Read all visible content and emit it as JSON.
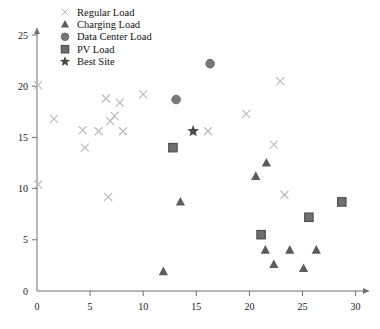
{
  "chart_data": {
    "type": "scatter",
    "title": "",
    "xlabel": "",
    "ylabel": "",
    "xlim": [
      0,
      31.5
    ],
    "ylim": [
      0,
      27.5
    ],
    "xticks": [
      0,
      5,
      10,
      15,
      20,
      25,
      30
    ],
    "yticks": [
      0,
      5,
      10,
      15,
      20,
      25
    ],
    "grid": false,
    "legend_position": "top-left",
    "series": [
      {
        "name": "Regular Load",
        "marker": "x",
        "color": "#b9b9b9",
        "points": [
          [
            0.1,
            20.1
          ],
          [
            1.6,
            16.8
          ],
          [
            0.1,
            10.4
          ],
          [
            4.3,
            15.7
          ],
          [
            4.5,
            14.0
          ],
          [
            5.8,
            15.6
          ],
          [
            6.5,
            18.8
          ],
          [
            6.7,
            9.2
          ],
          [
            6.9,
            16.6
          ],
          [
            7.3,
            17.1
          ],
          [
            7.8,
            18.4
          ],
          [
            8.1,
            15.6
          ],
          [
            10.0,
            19.2
          ],
          [
            16.1,
            15.6
          ],
          [
            19.7,
            17.3
          ],
          [
            22.9,
            20.5
          ],
          [
            22.3,
            14.3
          ],
          [
            23.3,
            9.4
          ]
        ]
      },
      {
        "name": "Charging Load",
        "marker": "triangle",
        "color": "#5c5c5c",
        "points": [
          [
            11.9,
            1.9
          ],
          [
            13.5,
            8.7
          ],
          [
            20.6,
            11.2
          ],
          [
            21.6,
            12.5
          ],
          [
            21.5,
            4.0
          ],
          [
            22.3,
            2.6
          ],
          [
            23.8,
            4.0
          ],
          [
            25.1,
            2.2
          ],
          [
            26.3,
            4.0
          ]
        ]
      },
      {
        "name": "Data Center Load",
        "marker": "circle",
        "color": "#787878",
        "points": [
          [
            13.1,
            18.7
          ],
          [
            16.3,
            22.2
          ]
        ]
      },
      {
        "name": "PV Load",
        "marker": "square",
        "color": "#6f6f6f",
        "points": [
          [
            12.8,
            14.0
          ],
          [
            21.1,
            5.5
          ],
          [
            25.6,
            7.2
          ],
          [
            28.7,
            8.7
          ]
        ]
      },
      {
        "name": "Best Site",
        "marker": "star",
        "color": "#4a4a4a",
        "points": [
          [
            14.7,
            15.6
          ]
        ]
      }
    ]
  },
  "legend": {
    "items": [
      {
        "label": "Regular Load",
        "marker": "x",
        "color": "#b9b9b9"
      },
      {
        "label": "Charging Load",
        "marker": "triangle",
        "color": "#5c5c5c"
      },
      {
        "label": "Data Center Load",
        "marker": "circle",
        "color": "#787878"
      },
      {
        "label": "PV Load",
        "marker": "square",
        "color": "#6f6f6f"
      },
      {
        "label": "Best Site",
        "marker": "star",
        "color": "#4a4a4a"
      }
    ]
  },
  "axes": {
    "axis_color": "#6e6e6e",
    "tick_color": "#1a1a1a"
  }
}
